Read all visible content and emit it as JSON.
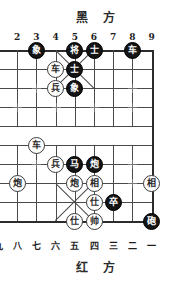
{
  "titles": {
    "black_side": "黑 方",
    "red_side": "红 方"
  },
  "files": {
    "top_labels": [
      "2",
      "3",
      "4",
      "5",
      "6",
      "7",
      "8",
      "9"
    ],
    "bottom_labels": [
      "九",
      "八",
      "七",
      "六",
      "五",
      "四",
      "三",
      "二",
      "一"
    ]
  },
  "colors": {
    "black_piece_bg": "#141414",
    "black_piece_fg": "#ffffff",
    "red_piece_bg": "#ffffff",
    "red_piece_fg": "#2a2a2a",
    "line": "#4a4a4a",
    "board_bg": "#ffffff"
  },
  "board": {
    "type": "xiangqi",
    "note": "Board is cropped on the left; file 1 column is off-screen.",
    "pieces": [
      {
        "name": "black-elephant",
        "glyph": "象",
        "side": "black",
        "col": 3,
        "row": 0
      },
      {
        "name": "black-general",
        "glyph": "将",
        "side": "black",
        "col": 5,
        "row": 0
      },
      {
        "name": "black-advisor-1",
        "glyph": "士",
        "side": "black",
        "col": 6,
        "row": 0
      },
      {
        "name": "black-chariot",
        "glyph": "车",
        "side": "black",
        "col": 8,
        "row": 0
      },
      {
        "name": "red-chariot-1",
        "glyph": "车",
        "side": "red",
        "col": 4,
        "row": 1
      },
      {
        "name": "black-advisor-2",
        "glyph": "士",
        "side": "black",
        "col": 5,
        "row": 1
      },
      {
        "name": "red-soldier-1",
        "glyph": "兵",
        "side": "red",
        "col": 4,
        "row": 2
      },
      {
        "name": "black-elephant-2",
        "glyph": "象",
        "side": "black",
        "col": 5,
        "row": 2
      },
      {
        "name": "red-chariot-2",
        "glyph": "车",
        "side": "red",
        "col": 3,
        "row": 5
      },
      {
        "name": "red-soldier-2",
        "glyph": "兵",
        "side": "red",
        "col": 4,
        "row": 6
      },
      {
        "name": "black-horse",
        "glyph": "马",
        "side": "black",
        "col": 5,
        "row": 6
      },
      {
        "name": "black-cannon-1",
        "glyph": "炮",
        "side": "black",
        "col": 6,
        "row": 6
      },
      {
        "name": "red-cannon-1",
        "glyph": "炮",
        "side": "red",
        "col": 2,
        "row": 7
      },
      {
        "name": "red-cannon-2",
        "glyph": "炮",
        "side": "red",
        "col": 5,
        "row": 7
      },
      {
        "name": "red-elephant-1",
        "glyph": "相",
        "side": "red",
        "col": 6,
        "row": 7
      },
      {
        "name": "red-elephant-2",
        "glyph": "相",
        "side": "red",
        "col": 9,
        "row": 7
      },
      {
        "name": "red-advisor-1",
        "glyph": "仕",
        "side": "red",
        "col": 6,
        "row": 8
      },
      {
        "name": "black-soldier",
        "glyph": "卒",
        "side": "black",
        "col": 7,
        "row": 8
      },
      {
        "name": "red-advisor-2",
        "glyph": "仕",
        "side": "red",
        "col": 5,
        "row": 9
      },
      {
        "name": "red-general",
        "glyph": "帅",
        "side": "red",
        "col": 6,
        "row": 9
      },
      {
        "name": "black-cannon-2",
        "glyph": "砲",
        "side": "black",
        "col": 9,
        "row": 9
      }
    ],
    "star_points": [
      {
        "col": 3,
        "row": 2
      },
      {
        "col": 8,
        "row": 2
      },
      {
        "col": 2,
        "row": 3
      },
      {
        "col": 4,
        "row": 3
      },
      {
        "col": 6,
        "row": 3
      },
      {
        "col": 8,
        "row": 3
      },
      {
        "col": 3,
        "row": 6
      },
      {
        "col": 8,
        "row": 6
      },
      {
        "col": 8,
        "row": 7
      }
    ]
  }
}
